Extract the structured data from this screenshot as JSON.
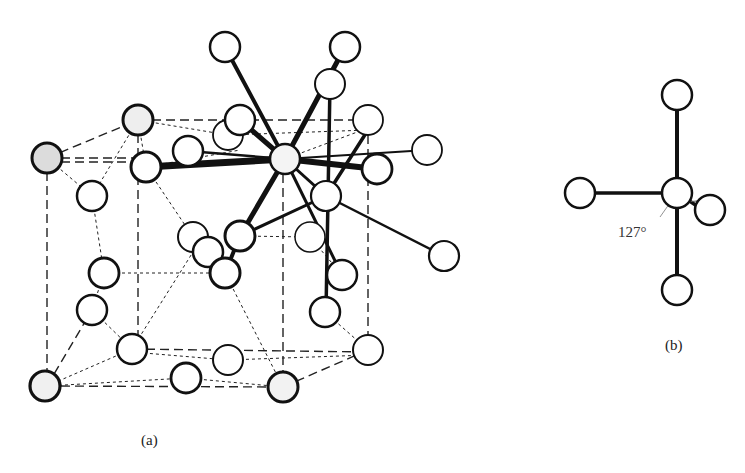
{
  "figure": {
    "panel_a": {
      "caption": "(a)",
      "description": "Crystal structure unit cell with central atom bonded to neighbors"
    },
    "panel_b": {
      "caption": "(b)",
      "angle_label": "127°",
      "description": "Coordination geometry around central atom"
    }
  },
  "colors": {
    "ink": "#111111",
    "shaded_atom": "#e6e6e6",
    "background": "#ffffff"
  }
}
